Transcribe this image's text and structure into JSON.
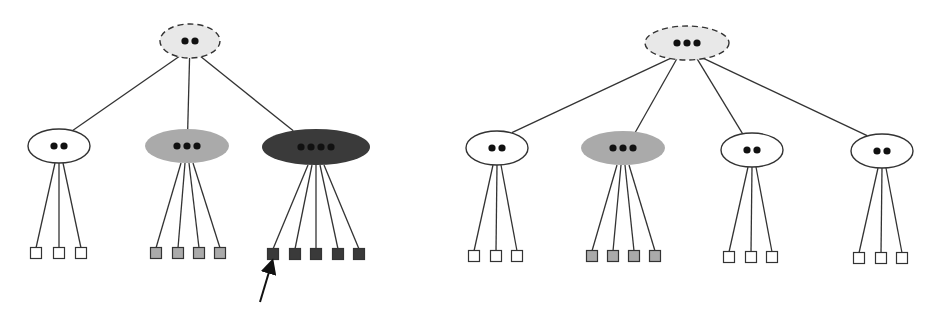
{
  "colors": {
    "background": "#ffffff",
    "stroke": "#333333",
    "root_fill": "#e8e8e8",
    "white_fill": "#ffffff",
    "light_gray_fill": "#aaaaaa",
    "dark_fill": "#3a3a3a",
    "dot": "#111111"
  },
  "diagrams": [
    {
      "id": "left-tree",
      "root": {
        "cx": 190,
        "cy": 41,
        "rx": 30,
        "ry": 17,
        "fill": "root",
        "dashed": true,
        "dots": 2
      },
      "children": [
        {
          "cx": 59,
          "cy": 146,
          "rx": 31,
          "ry": 17,
          "fill": "white",
          "dots": 2,
          "leaf_fill": "white",
          "leaves_x": [
            36,
            59,
            81
          ],
          "leaf_y": 253
        },
        {
          "cx": 187,
          "cy": 146,
          "rx": 42,
          "ry": 17,
          "fill": "light",
          "dots": 3,
          "leaf_fill": "light",
          "leaves_x": [
            156,
            178,
            199,
            220
          ],
          "leaf_y": 253
        },
        {
          "cx": 316,
          "cy": 147,
          "rx": 54,
          "ry": 18,
          "fill": "dark",
          "dots": 4,
          "leaf_fill": "dark",
          "leaves_x": [
            273,
            295,
            316,
            338,
            359
          ],
          "leaf_y": 254
        }
      ],
      "arrow": {
        "x1": 260,
        "y1": 302,
        "x2": 272,
        "y2": 262
      }
    },
    {
      "id": "right-tree",
      "root": {
        "cx": 687,
        "cy": 43,
        "rx": 42,
        "ry": 17,
        "fill": "root",
        "dashed": true,
        "dots": 3
      },
      "children": [
        {
          "cx": 497,
          "cy": 148,
          "rx": 31,
          "ry": 17,
          "fill": "white",
          "dots": 2,
          "leaf_fill": "white",
          "leaves_x": [
            474,
            496,
            517
          ],
          "leaf_y": 256
        },
        {
          "cx": 623,
          "cy": 148,
          "rx": 42,
          "ry": 17,
          "fill": "light",
          "dots": 3,
          "leaf_fill": "light",
          "leaves_x": [
            592,
            613,
            634,
            655
          ],
          "leaf_y": 256
        },
        {
          "cx": 752,
          "cy": 150,
          "rx": 31,
          "ry": 17,
          "fill": "white",
          "dots": 2,
          "leaf_fill": "white",
          "leaves_x": [
            729,
            751,
            772
          ],
          "leaf_y": 257
        },
        {
          "cx": 882,
          "cy": 151,
          "rx": 31,
          "ry": 17,
          "fill": "white",
          "dots": 2,
          "leaf_fill": "white",
          "leaves_x": [
            859,
            881,
            902
          ],
          "leaf_y": 258
        }
      ]
    }
  ]
}
